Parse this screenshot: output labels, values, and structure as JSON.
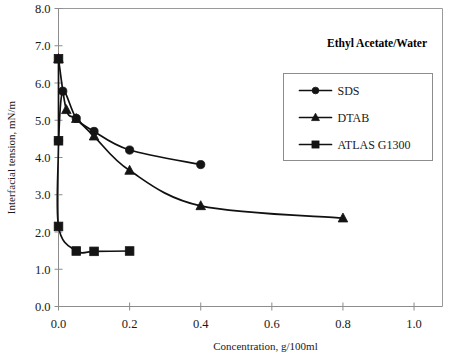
{
  "chart_data": {
    "type": "line",
    "title": "Ethyl Acetate/Water",
    "xlabel": "Concentration, g/100ml",
    "ylabel": "Interfacial tension,  mN/m",
    "xlim": [
      0.0,
      1.08
    ],
    "ylim": [
      0.0,
      8.0
    ],
    "xticks": [
      0.0,
      0.2,
      0.4,
      0.6,
      0.8,
      1.0
    ],
    "xticklabels": [
      "0.0",
      "0.2",
      "0.4",
      "0.6",
      "0.8",
      "1.0"
    ],
    "yticks": [
      0.0,
      1.0,
      2.0,
      3.0,
      4.0,
      5.0,
      6.0,
      7.0,
      8.0
    ],
    "yticklabels": [
      "0.0",
      "1.0",
      "2.0",
      "3.0",
      "4.0",
      "5.0",
      "6.0",
      "7.0",
      "8.0"
    ],
    "grid": false,
    "legend_position": "upper-right",
    "series": [
      {
        "name": "SDS",
        "marker": "circle",
        "color": "#141414",
        "points": [
          {
            "x": 0.0,
            "y": 4.45
          },
          {
            "x": 0.012,
            "y": 5.78
          },
          {
            "x": 0.05,
            "y": 5.05
          },
          {
            "x": 0.1,
            "y": 4.7
          },
          {
            "x": 0.2,
            "y": 4.2
          },
          {
            "x": 0.4,
            "y": 3.81
          }
        ]
      },
      {
        "name": "DTAB",
        "marker": "triangle",
        "color": "#141414",
        "points": [
          {
            "x": 0.0,
            "y": 6.65
          },
          {
            "x": 0.022,
            "y": 5.28
          },
          {
            "x": 0.05,
            "y": 5.04
          },
          {
            "x": 0.1,
            "y": 4.57
          },
          {
            "x": 0.2,
            "y": 3.65
          },
          {
            "x": 0.4,
            "y": 2.7
          },
          {
            "x": 0.8,
            "y": 2.37
          }
        ]
      },
      {
        "name": "ATLAS G1300",
        "marker": "square",
        "color": "#141414",
        "points": [
          {
            "x": 0.0,
            "y": 6.65
          },
          {
            "x": 0.0,
            "y": 4.45
          },
          {
            "x": 0.0,
            "y": 2.15
          },
          {
            "x": 0.05,
            "y": 1.49
          },
          {
            "x": 0.1,
            "y": 1.48
          },
          {
            "x": 0.2,
            "y": 1.49
          }
        ]
      }
    ]
  },
  "legend": {
    "entries": [
      {
        "label": "SDS",
        "marker": "circle"
      },
      {
        "label": "DTAB",
        "marker": "triangle"
      },
      {
        "label": "ATLAS G1300",
        "marker": "square"
      }
    ]
  }
}
